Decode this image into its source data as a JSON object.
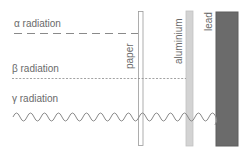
{
  "diagram": {
    "type": "radiation-penetration",
    "radiation": [
      {
        "symbol": "α",
        "label": "α radiation",
        "line_style": "long-dashed",
        "stopped_by": "paper"
      },
      {
        "symbol": "β",
        "label": "β radiation",
        "line_style": "short-dotted",
        "stopped_by": "aluminium"
      },
      {
        "symbol": "γ",
        "label": "γ radiation",
        "line_style": "sine-wave",
        "stopped_by": "lead"
      }
    ],
    "barriers": [
      {
        "name": "paper",
        "label": "paper",
        "color": "#ffffff",
        "border": "#9a9a9a"
      },
      {
        "name": "aluminium",
        "label": "aluminium",
        "color": "#d2d2d2",
        "border": "#c4c4c4"
      },
      {
        "name": "lead",
        "label": "lead",
        "color": "#6b6b6b",
        "border": "#5a5a5a"
      }
    ]
  },
  "colors": {
    "text": "#6a6a6a",
    "line": "#8a8a8a"
  }
}
